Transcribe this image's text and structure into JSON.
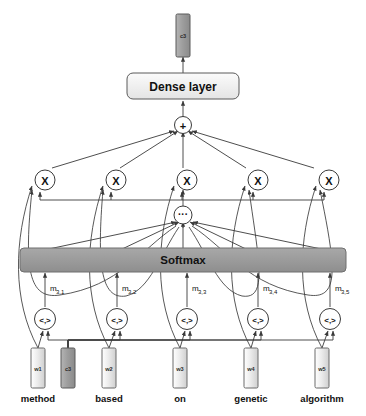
{
  "figure": {
    "background_color": "#ffffff",
    "stroke_color": "#3a3a3a",
    "fill_light": "#d9d9d9",
    "fill_lighter": "#e6e6e6",
    "fill_dark": "#9b9b9b",
    "fill_gray_bar": "#999999",
    "text_color": "#111111"
  },
  "output": {
    "box_label": "c3",
    "name": "output-vector"
  },
  "dense": {
    "label": "Dense layer"
  },
  "sum_node": {
    "label": "+"
  },
  "softmax": {
    "label": "Softmax"
  },
  "distribute_node": {
    "label": "···"
  },
  "multiply_nodes": [
    {
      "label": "X",
      "index": 1
    },
    {
      "label": "X",
      "index": 2
    },
    {
      "label": "X",
      "index": 3
    },
    {
      "label": "X",
      "index": 4
    },
    {
      "label": "X",
      "index": 5
    }
  ],
  "inner_product_nodes": [
    {
      "label": "<,>",
      "index": 1
    },
    {
      "label": "<,>",
      "index": 2
    },
    {
      "label": "<,>",
      "index": 3
    },
    {
      "label": "<,>",
      "index": 4
    },
    {
      "label": "<,>",
      "index": 5
    }
  ],
  "attention_scores": [
    {
      "base": "m",
      "sub": "3,1"
    },
    {
      "base": "m",
      "sub": "3,2"
    },
    {
      "base": "m",
      "sub": "3,3"
    },
    {
      "base": "m",
      "sub": "3,4"
    },
    {
      "base": "m",
      "sub": "3,5"
    }
  ],
  "word_columns": [
    {
      "vector_label": "w1",
      "word": "method"
    },
    {
      "vector_label": "w2",
      "word": "based"
    },
    {
      "vector_label": "w3",
      "word": "on"
    },
    {
      "vector_label": "w4",
      "word": "genetic"
    },
    {
      "vector_label": "w5",
      "word": "algorithm"
    }
  ],
  "context_vector": {
    "label": "c3",
    "name": "context-vector-input"
  }
}
